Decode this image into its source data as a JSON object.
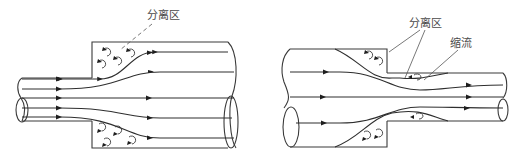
{
  "figures": [
    {
      "id": "sudden-expansion",
      "labels": {
        "separation_zone": "分离区"
      }
    },
    {
      "id": "sudden-contraction",
      "labels": {
        "separation_zone": "分离区",
        "vena_contracta": "缩流"
      }
    }
  ],
  "colors": {
    "line": "#3a3a3a",
    "label": "#4a4a4a",
    "background": "#ffffff"
  }
}
